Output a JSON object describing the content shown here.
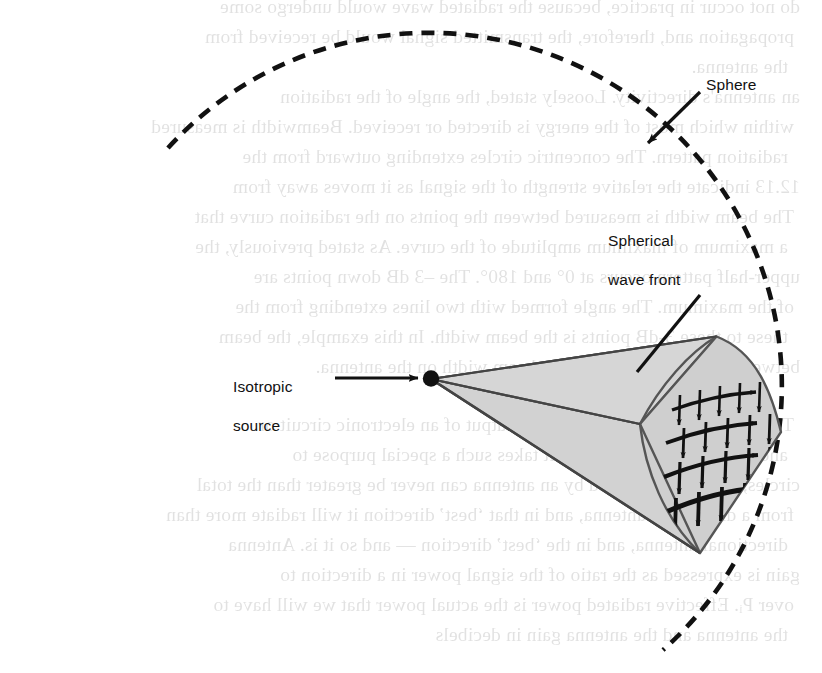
{
  "figure": {
    "background_color": "#ffffff",
    "ink_color": "#111111",
    "wedge_fill_color": "#d2d2d2",
    "wedge_fill_color_dark": "#bdbdbd",
    "wedge_edge_color": "#555555",
    "sphere_stroke_color": "#111111"
  },
  "labels": {
    "sphere": "Sphere",
    "wave_front_line1": "Spherical",
    "wave_front_line2": "wave front",
    "source_line1": "Isotropic",
    "source_line2": "source"
  },
  "geometry": {
    "sphere_center_x": 430,
    "sphere_center_y": 355,
    "sphere_radius": 353,
    "source_x": 430,
    "source_y": 378,
    "dash_pattern": "13 9"
  },
  "annotations": {
    "sphere_arrow": "arrow pointing down-left from Sphere label to the dashed sphere outline",
    "wave_front_leader": "line from Spherical wave front label down-left to the curved end cap",
    "source_arrow": "arrow pointing right from Isotropic source label to the black source dot"
  },
  "field_vectors": {
    "description": "grid of electric and magnetic field vectors drawn on the spherical wave front cap",
    "row_count": 4,
    "column_count": 6,
    "horizontal_arrow_direction": "right",
    "vertical_arrow_direction": "down"
  },
  "bleed_through_text": [
    "do not occur in practice, because the radiated wave would undergo some",
    "propagation and, therefore, the transmitted signal would be received from",
    "the antenna.",
    "an antenna's  directivity.  Loosely  stated,  the  angle  of  the  radiation",
    "within which most of the energy is directed or received. Beamwidth is measured",
    "radiation pattern.  The concentric circles extending outward from the",
    "12.13 indicate the relative strength of the signal as it moves away from",
    "The beam width is measured between the points on the radiation curve that",
    "a maximum of maximum amplitude of the curve. As stated previously, the",
    "upper-half pattern occurs at 0° and 180°. The –3 dB down points are",
    "of the maximum. The angle formed with two lines extending from the",
    "these to these 3-dB points is the beam width. In this example, the beam",
    "between these 3-dB points is the beam width on the antenna.",
    "The antenna gain is defined as the output of an electronic circuit or",
    "and is expressed in decibels. It takes such a special purpose to",
    "circles, the power radiated by an antenna can never be greater than the total",
    "from a directional antenna, and in that ‘best’ direction it will radiate more than",
    "directional antenna, and in the ‘best’ direction — and so it is. Antenna",
    "gain is expressed as the ratio of the signal power in a direction to",
    "over Pᵢ. Effective radiated power is the actual power that we will have to",
    "the antenna and the antenna gain in decibels"
  ]
}
